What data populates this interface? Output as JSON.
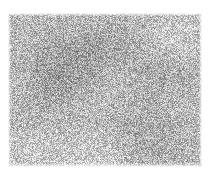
{
  "image": {
    "kind": "noise-texture",
    "title": "Grayscale random noise texture",
    "caption": "",
    "canvas": {
      "width": 208,
      "height": 174,
      "background_color": "#ffffff"
    },
    "texture_region": {
      "x": 8,
      "y": 13,
      "width": 194,
      "height": 154
    },
    "appearance": {
      "color_mode": "grayscale",
      "grain_size_px": 1,
      "mean_level": 186,
      "noise_amplitude": 62,
      "min_level": 78,
      "max_level": 255,
      "darkest_tone": "#4e4e4e",
      "lightest_tone": "#ffffff",
      "mid_tone": "#bababa",
      "seed": 20240517
    },
    "shading_clusters": [
      {
        "name": "upper-left-dark-patch",
        "cx": 0.3,
        "cy": 0.32,
        "radius": 0.3,
        "delta": -26
      },
      {
        "name": "upper-center-dark-patch",
        "cx": 0.52,
        "cy": 0.2,
        "radius": 0.26,
        "delta": -14
      },
      {
        "name": "center-left-dark-streak",
        "cx": 0.22,
        "cy": 0.52,
        "radius": 0.24,
        "delta": -12
      },
      {
        "name": "right-mid-dark-patch",
        "cx": 0.78,
        "cy": 0.45,
        "radius": 0.26,
        "delta": -14
      },
      {
        "name": "lower-right-dark-patch",
        "cx": 0.72,
        "cy": 0.8,
        "radius": 0.28,
        "delta": -16
      },
      {
        "name": "upper-right-light-patch",
        "cx": 0.88,
        "cy": 0.12,
        "radius": 0.22,
        "delta": 18
      },
      {
        "name": "lower-left-light-patch",
        "cx": 0.12,
        "cy": 0.88,
        "radius": 0.22,
        "delta": 16
      },
      {
        "name": "bottom-edge-light-band",
        "cx": 0.45,
        "cy": 0.97,
        "radius": 0.3,
        "delta": 20
      }
    ],
    "edge_fade": {
      "top_px": 3,
      "bottom_px": 4,
      "left_px": 3,
      "right_px": 3
    }
  }
}
